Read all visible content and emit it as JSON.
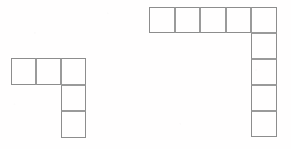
{
  "image": {
    "title": "Two L-shaped grid figures",
    "width": 291,
    "height": 149,
    "background_color": "#fffefe",
    "line_color": "#8d8d8d",
    "line_color_interior": "#9a9a9a",
    "line_width_px": 1
  },
  "figures": [
    {
      "name": "left-figure",
      "shape_label": "L-shape",
      "total_cells": 5,
      "origin": {
        "x": 11,
        "y": 58
      },
      "cell": {
        "width": 25,
        "height": 26.5
      },
      "rows_description": "top row of 3 cells, right column extends 2 more cells downward",
      "cells": [
        {
          "col": 0,
          "row": 0
        },
        {
          "col": 1,
          "row": 0
        },
        {
          "col": 2,
          "row": 0
        },
        {
          "col": 2,
          "row": 1
        },
        {
          "col": 2,
          "row": 2
        }
      ]
    },
    {
      "name": "right-figure",
      "shape_label": "L-shape",
      "total_cells": 9,
      "origin": {
        "x": 149,
        "y": 7
      },
      "cell": {
        "width": 25.6,
        "height": 26
      },
      "rows_description": "top row of 5 cells, right column extends 4 more cells downward",
      "cells": [
        {
          "col": 0,
          "row": 0
        },
        {
          "col": 1,
          "row": 0
        },
        {
          "col": 2,
          "row": 0
        },
        {
          "col": 3,
          "row": 0
        },
        {
          "col": 4,
          "row": 0
        },
        {
          "col": 4,
          "row": 1
        },
        {
          "col": 4,
          "row": 2
        },
        {
          "col": 4,
          "row": 3
        },
        {
          "col": 4,
          "row": 4
        }
      ]
    }
  ]
}
